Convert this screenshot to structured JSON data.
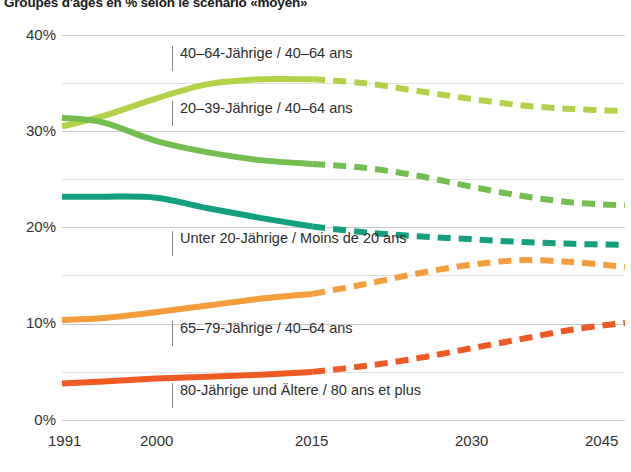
{
  "title": "Groupes d'âges en % selon le scénario «moyen»",
  "axes": {
    "y_ticks": [
      "0%",
      "10%",
      "20%",
      "30%",
      "40%"
    ],
    "x_ticks": [
      "1991",
      "2000",
      "2015",
      "2030",
      "2045"
    ]
  },
  "labels": {
    "l1": "40–64-Jährige / 40–64 ans",
    "l2": "20–39-Jährige / 40–64 ans",
    "l3": "Unter 20-Jährige / Moins de 20 ans",
    "l4": "65–79-Jährige / 40–64 ans",
    "l5": "80-Jährige und Ältere / 80 ans et plus"
  },
  "colors": {
    "age_40_64": "#b3d24a",
    "age_20_39": "#72bf50",
    "age_under20": "#14a07e",
    "age_65_79": "#f59c3c",
    "age_80plus": "#ef5a24",
    "grid": "#c9c9c9",
    "grid_minor": "#e2e2e2",
    "text": "#333333"
  },
  "chart_data": {
    "type": "line",
    "title": "Groupes d'âges en % selon le scénario «moyen»",
    "xlabel": "",
    "ylabel": "",
    "xlim": [
      1991,
      2045
    ],
    "ylim": [
      0,
      40
    ],
    "ytick_values": [
      0,
      10,
      20,
      30,
      40
    ],
    "xtick_values": [
      1991,
      2000,
      2015,
      2030,
      2045
    ],
    "grid": true,
    "legend": "inline-annotations",
    "projection_starts_at": 2015,
    "note": "Solid segments = observed (1991–2015); dashed segments = projection (2015–2045)",
    "x": [
      1991,
      1995,
      2000,
      2005,
      2010,
      2015,
      2020,
      2025,
      2030,
      2035,
      2040,
      2045
    ],
    "series": [
      {
        "name": "40–64-Jährige / 40–64 ans",
        "color": "#b3d24a",
        "values": [
          30.5,
          31.6,
          33.4,
          34.9,
          35.4,
          35.4,
          35.0,
          34.2,
          33.4,
          32.7,
          32.3,
          32.1
        ]
      },
      {
        "name": "20–39-Jährige / 40–64 ans",
        "color": "#72bf50",
        "values": [
          31.4,
          30.9,
          29.0,
          27.8,
          27.0,
          26.6,
          26.2,
          25.4,
          24.3,
          23.3,
          22.6,
          22.3
        ]
      },
      {
        "name": "Unter 20-Jährige / Moins de 20 ans",
        "color": "#14a07e",
        "values": [
          23.2,
          23.2,
          23.1,
          22.0,
          21.0,
          20.1,
          19.5,
          19.1,
          18.8,
          18.5,
          18.3,
          18.2
        ]
      },
      {
        "name": "65–79-Jährige / 40–64 ans",
        "color": "#f59c3c",
        "values": [
          10.4,
          10.6,
          11.2,
          11.9,
          12.6,
          13.1,
          14.1,
          15.2,
          16.1,
          16.6,
          16.4,
          15.9
        ]
      },
      {
        "name": "80-Jährige und Ältere / 80 ans et plus",
        "color": "#ef5a24",
        "values": [
          3.8,
          4.0,
          4.3,
          4.5,
          4.7,
          5.0,
          5.6,
          6.4,
          7.4,
          8.4,
          9.4,
          10.1
        ]
      }
    ]
  }
}
